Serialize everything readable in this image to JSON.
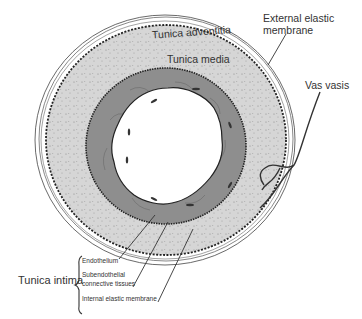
{
  "diagram": {
    "labels": {
      "tunica_adventitia": "Tunica adventitia",
      "tunica_media": "Tunica media",
      "external_elastic_membrane_line1": "External elastic",
      "external_elastic_membrane_line2": "membrane",
      "vas_vasis": "Vas vasis",
      "tunica_intima": "Tunica intima",
      "endothelium": "Endothelium",
      "subendothelial_line1": "Subendothelial",
      "subendothelial_line2": "connective tissues",
      "internal_elastic_membrane": "Internal elastic membrane"
    },
    "colors": {
      "adventitia_fill": "#ffffff",
      "media_fill": "#d9d9d9",
      "intima_fill": "#8c8c8c",
      "lumen_fill": "#ffffff",
      "line": "#333333"
    }
  }
}
